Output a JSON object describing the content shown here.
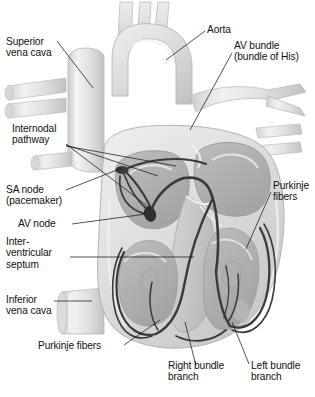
{
  "figure": {
    "type": "anatomical-illustration",
    "style": "grayscale halftone medical illustration",
    "background_color": "#ffffff",
    "ink_color": "#111111",
    "conduction_line_color": "#3a3a3a",
    "tissue_light": "#e8e8e8",
    "tissue_mid": "#c9c9c9",
    "tissue_dark": "#a6a6a6",
    "chamber_fill": "#b4b4b4",
    "vessel_fill": "#e2e2e2"
  },
  "labels": [
    {
      "id": "superior-vena-cava",
      "lines": [
        "Superior",
        "vena cava"
      ]
    },
    {
      "id": "aorta",
      "lines": [
        "Aorta"
      ]
    },
    {
      "id": "av-bundle",
      "lines": [
        "AV bundle",
        "(bundle of His)"
      ]
    },
    {
      "id": "internodal-pathway",
      "lines": [
        "Internodal",
        "pathway"
      ]
    },
    {
      "id": "sa-node",
      "lines": [
        "SA node",
        "(pacemaker)"
      ]
    },
    {
      "id": "av-node",
      "lines": [
        "AV node"
      ]
    },
    {
      "id": "interventricular-septum",
      "lines": [
        "Inter-",
        "ventricular",
        "septum"
      ]
    },
    {
      "id": "inferior-vena-cava",
      "lines": [
        "Inferior",
        "vena cava"
      ]
    },
    {
      "id": "purkinje-fibers-right",
      "lines": [
        "Purkinje",
        "fibers"
      ]
    },
    {
      "id": "purkinje-fibers-left",
      "lines": [
        "Purkinje fibers"
      ]
    },
    {
      "id": "right-bundle-branch",
      "lines": [
        "Right bundle",
        "branch"
      ]
    },
    {
      "id": "left-bundle-branch",
      "lines": [
        "Left bundle",
        "branch"
      ]
    }
  ],
  "text": {
    "superior_vena_cava_l1": "Superior",
    "superior_vena_cava_l2": "vena cava",
    "aorta": "Aorta",
    "av_bundle_l1": "AV bundle",
    "av_bundle_l2": "(bundle of His)",
    "internodal_l1": "Internodal",
    "internodal_l2": "pathway",
    "sa_node_l1": "SA node",
    "sa_node_l2": "(pacemaker)",
    "av_node": "AV node",
    "ivs_l1": "Inter-",
    "ivs_l2": "ventricular",
    "ivs_l3": "septum",
    "ivc_l1": "Inferior",
    "ivc_l2": "vena cava",
    "purkinje_right_l1": "Purkinje",
    "purkinje_right_l2": "fibers",
    "purkinje_left": "Purkinje fibers",
    "right_bundle_l1": "Right bundle",
    "right_bundle_l2": "branch",
    "left_bundle_l1": "Left bundle",
    "left_bundle_l2": "branch"
  }
}
